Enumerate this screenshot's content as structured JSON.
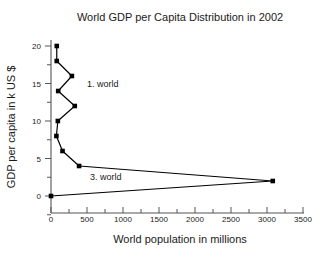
{
  "chart_data": {
    "type": "line",
    "title": "World GDP per Capita Distribution in 2002",
    "xlabel": "World population in millions",
    "ylabel": "GDP per capita in k US $",
    "xlim": [
      -150,
      3600
    ],
    "ylim": [
      -2.8,
      22.5
    ],
    "xticks": [
      0,
      500,
      1000,
      1500,
      2000,
      2500,
      3000,
      3500
    ],
    "yticks": [
      0,
      5,
      10,
      15,
      20
    ],
    "xtick_labels": [
      "0",
      "500",
      "1000",
      "1500",
      "2000",
      "2500",
      "3000",
      "3500"
    ],
    "ytick_labels": [
      "0",
      "5",
      "10",
      "15",
      "20"
    ],
    "grid": false,
    "legend": "none",
    "marker": "filled-square",
    "line_color": "#000000",
    "marker_color": "#000000",
    "axis_color": "#555555",
    "background_color": "#ffffff",
    "series": [
      {
        "name": "World GDP per capita distribution",
        "x": [
          80,
          80,
          290,
          100,
          330,
          95,
          75,
          160,
          390,
          3080,
          0
        ],
        "y": [
          20,
          18,
          16,
          14,
          12,
          10,
          8,
          6,
          4,
          2,
          0
        ],
        "xlabel_unit": "millions of people",
        "ylabel_unit": "thousand US $"
      }
    ],
    "annotations": [
      {
        "text": "1. world",
        "x": 720,
        "y": 15.0
      },
      {
        "text": "3. world",
        "x": 760,
        "y": 2.6
      }
    ]
  }
}
